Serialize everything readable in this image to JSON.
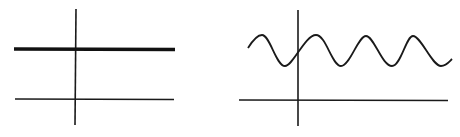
{
  "diagram": {
    "panels": [
      {
        "name": "constant-signal",
        "description": "Horizontal constant line above horizontal axis",
        "axis_color": "#111111",
        "signal_color": "#111111"
      },
      {
        "name": "sinusoidal-signal",
        "description": "Sine wave offset above horizontal axis",
        "axis_color": "#111111",
        "signal_color": "#111111"
      }
    ]
  }
}
